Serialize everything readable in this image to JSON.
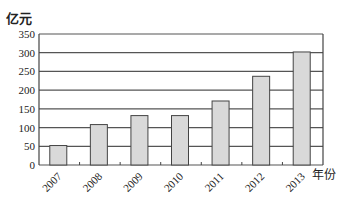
{
  "chart_data": {
    "type": "bar",
    "title": "",
    "ylabel": "亿元",
    "xlabel": "年份",
    "categories": [
      "2007",
      "2008",
      "2009",
      "2010",
      "2011",
      "2012",
      "2013"
    ],
    "values": [
      52,
      108,
      132,
      132,
      171,
      237,
      302
    ],
    "ylim": [
      0,
      350
    ],
    "yticks": [
      0,
      50,
      100,
      150,
      200,
      250,
      300,
      350
    ],
    "grid": true,
    "bar_color": "#d9d9d9",
    "edge_color": "#444444"
  }
}
